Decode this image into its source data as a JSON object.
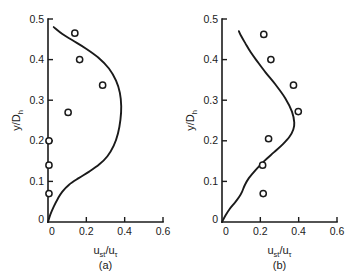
{
  "figure": {
    "background_color": "#ffffff",
    "ink_color": "#1a1a1a",
    "width": 348,
    "height": 280
  },
  "chart_data": [
    {
      "type": "scatter",
      "panel_id": "a",
      "panel_label": "(a)",
      "title": "",
      "xlabel": "u_st/u_tau",
      "xlabel_main": "u",
      "xlabel_sub1": "st",
      "xlabel_mid": "/u",
      "xlabel_sub2": "τ",
      "ylabel": "y/D_h",
      "ylabel_main": "y/D",
      "ylabel_sub": "h",
      "xlim": [
        0,
        0.6
      ],
      "ylim": [
        0,
        0.5
      ],
      "xticks": [
        0,
        0.2,
        0.4,
        0.6
      ],
      "xticklabels": [
        "0",
        "0.2",
        "0.4",
        "0.6"
      ],
      "yticks": [
        0,
        0.1,
        0.2,
        0.3,
        0.4,
        0.5
      ],
      "yticklabels": [
        "0",
        "0.1",
        "0.2",
        "0.3",
        "0.4",
        "0.5"
      ],
      "grid": false,
      "legend": "none",
      "series": [
        {
          "name": "measured",
          "kind": "markers",
          "marker": "open-circle",
          "x": [
            0.005,
            0.005,
            0.005,
            0.105,
            0.165,
            0.285,
            0.14
          ],
          "y": [
            0.07,
            0.14,
            0.2,
            0.27,
            0.4,
            0.337,
            0.465
          ]
        },
        {
          "name": "prediction",
          "kind": "line",
          "x": [
            0.0,
            0.012,
            0.03,
            0.052,
            0.075,
            0.11,
            0.16,
            0.215,
            0.268,
            0.31,
            0.343,
            0.365,
            0.378,
            0.382,
            0.375,
            0.355,
            0.318,
            0.262,
            0.195,
            0.13,
            0.075,
            0.03
          ],
          "y": [
            0.0,
            0.018,
            0.038,
            0.058,
            0.075,
            0.092,
            0.108,
            0.124,
            0.142,
            0.162,
            0.188,
            0.218,
            0.252,
            0.285,
            0.318,
            0.348,
            0.378,
            0.405,
            0.428,
            0.447,
            0.463,
            0.48
          ]
        }
      ]
    },
    {
      "type": "scatter",
      "panel_id": "b",
      "panel_label": "(b)",
      "title": "",
      "xlabel": "u_st/u_tau",
      "xlabel_main": "u",
      "xlabel_sub1": "st",
      "xlabel_mid": "/u",
      "xlabel_sub2": "τ",
      "ylabel": "y/D_h",
      "ylabel_main": "y/D",
      "ylabel_sub": "h",
      "xlim": [
        0,
        0.6
      ],
      "ylim": [
        0,
        0.5
      ],
      "xticks": [
        0,
        0.2,
        0.4,
        0.6
      ],
      "xticklabels": [
        "0",
        "0.2",
        "0.4",
        "0.6"
      ],
      "yticks": [
        0,
        0.1,
        0.2,
        0.3,
        0.4,
        0.5
      ],
      "yticklabels": [
        "0",
        "0.1",
        "0.2",
        "0.3",
        "0.4",
        "0.5"
      ],
      "grid": false,
      "legend": "none",
      "series": [
        {
          "name": "measured",
          "kind": "markers",
          "marker": "open-circle",
          "x": [
            0.215,
            0.212,
            0.243,
            0.398,
            0.373,
            0.255,
            0.218
          ],
          "y": [
            0.07,
            0.14,
            0.205,
            0.272,
            0.337,
            0.4,
            0.462
          ]
        },
        {
          "name": "prediction",
          "kind": "line",
          "x": [
            0.0,
            0.018,
            0.04,
            0.068,
            0.09,
            0.105,
            0.118,
            0.14,
            0.175,
            0.22,
            0.272,
            0.318,
            0.352,
            0.372,
            0.377,
            0.365,
            0.33,
            0.28,
            0.228,
            0.185,
            0.15,
            0.122,
            0.1,
            0.088
          ],
          "y": [
            0.0,
            0.016,
            0.032,
            0.048,
            0.062,
            0.075,
            0.09,
            0.108,
            0.128,
            0.15,
            0.172,
            0.192,
            0.21,
            0.228,
            0.245,
            0.272,
            0.305,
            0.338,
            0.368,
            0.395,
            0.418,
            0.44,
            0.458,
            0.47
          ]
        }
      ]
    }
  ]
}
